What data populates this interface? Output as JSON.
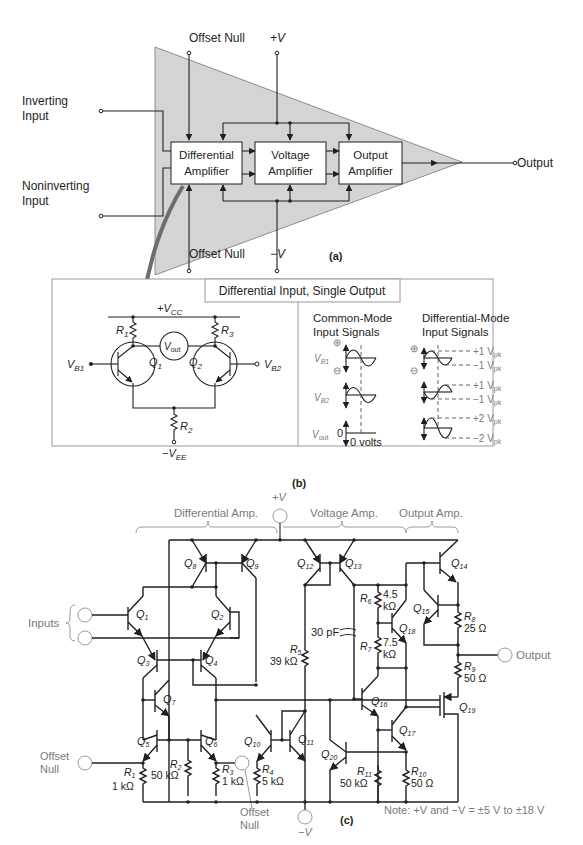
{
  "figure_a": {
    "label": "(a)",
    "offset_null_top": "Offset Null",
    "offset_null_bottom": "Offset Null",
    "plus_v": "+V",
    "minus_v": "−V",
    "inverting_input": [
      "Inverting",
      "Input"
    ],
    "noninverting_input": [
      "Noninverting",
      "Input"
    ],
    "output": "Output",
    "blocks": [
      {
        "line1": "Differential",
        "line2": "Amplifier"
      },
      {
        "line1": "Voltage",
        "line2": "Amplifier"
      },
      {
        "line1": "Output",
        "line2": "Amplifier"
      }
    ],
    "colors": {
      "triangle_fill": "#d4d4d4",
      "arrow": "#6d6e70"
    }
  },
  "figure_b": {
    "label": "(b)",
    "title": "Differential Input, Single Output",
    "vcc": "+V",
    "vcc_sub": "CC",
    "vee": "−V",
    "vee_sub": "EE",
    "vout": "V",
    "vout_sub": "out",
    "r1": "R",
    "r1_sub": "1",
    "r2": "R",
    "r2_sub": "2",
    "r3": "R",
    "r3_sub": "3",
    "q1": "Q",
    "q1_sub": "1",
    "q2": "Q",
    "q2_sub": "2",
    "vb1": "V",
    "vb1_sub": "B1",
    "vb2": "V",
    "vb2_sub": "B2",
    "common_mode": {
      "title": [
        "Common-Mode",
        "Input Signals"
      ],
      "vb1": "V",
      "vb1_sub": "B1",
      "vb2": "V",
      "vb2_sub": "B2",
      "vout": "V",
      "vout_sub": "out",
      "zero": "0",
      "zero_volts": "0 volts",
      "plus_symbol": "⊕",
      "minus_symbol": "⊖"
    },
    "differential_mode": {
      "title": [
        "Differential-Mode",
        "Input Signals"
      ],
      "levels": [
        "+1 V",
        "−1 V",
        "+1 V",
        "−1 V",
        "+2 V",
        "−2 V"
      ],
      "level_sub": "pk",
      "plus_symbol": "⊕",
      "minus_symbol": "⊖"
    }
  },
  "figure_c": {
    "label": "(c)",
    "sections": [
      "Differential Amp.",
      "Voltage Amp.",
      "Output Amp."
    ],
    "plus_v": "+V",
    "minus_v": "−V",
    "inputs": "Inputs",
    "output": "Output",
    "offset_null_left": [
      "Offset",
      "Null"
    ],
    "offset_null_bottom": [
      "Offset",
      "Null"
    ],
    "capacitor": "30 pF",
    "note": "Note: +V and −V = ±5 V to ±18 V",
    "transistors": [
      "1",
      "2",
      "3",
      "4",
      "5",
      "6",
      "7",
      "8",
      "9",
      "10",
      "11",
      "12",
      "13",
      "14",
      "15",
      "16",
      "17",
      "18",
      "19",
      "20"
    ],
    "resistors": [
      {
        "name": "R",
        "sub": "1",
        "value": "1 kΩ"
      },
      {
        "name": "R",
        "sub": "2",
        "value": "50 kΩ"
      },
      {
        "name": "R",
        "sub": "3",
        "value": "1 kΩ"
      },
      {
        "name": "R",
        "sub": "4",
        "value": "5 kΩ"
      },
      {
        "name": "R",
        "sub": "5",
        "value": "39 kΩ"
      },
      {
        "name": "R",
        "sub": "6",
        "value": [
          "4.5",
          "kΩ"
        ]
      },
      {
        "name": "R",
        "sub": "7",
        "value": [
          "7.5",
          "kΩ"
        ]
      },
      {
        "name": "R",
        "sub": "8",
        "value": "25 Ω"
      },
      {
        "name": "R",
        "sub": "9",
        "value": "50 Ω"
      },
      {
        "name": "R",
        "sub": "10",
        "value": "50 Ω"
      },
      {
        "name": "R",
        "sub": "11",
        "value": "50 kΩ"
      }
    ]
  }
}
